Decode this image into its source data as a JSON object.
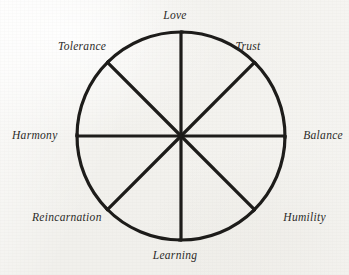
{
  "figure": {
    "name": "eight-spoked pinwheel diagram",
    "background_color": "#f1f0ec",
    "ink_color": "#1d1c1a",
    "center": {
      "x": 181,
      "y": 136
    },
    "spoke_length": 104,
    "spoke_count": 8,
    "spoke_angle_step_degrees": 45,
    "arc_sweep_degrees": 46,
    "stroke_width": 3.2,
    "labels": [
      {
        "id": "love",
        "text": "Love",
        "angle_degrees": 90,
        "position": "top"
      },
      {
        "id": "trust",
        "text": "Trust",
        "angle_degrees": 45,
        "position": "top-right"
      },
      {
        "id": "balance",
        "text": "Balance",
        "angle_degrees": 0,
        "position": "right"
      },
      {
        "id": "humility",
        "text": "Humility",
        "angle_degrees": 315,
        "position": "bottom-right"
      },
      {
        "id": "learning",
        "text": "Learning",
        "angle_degrees": 270,
        "position": "bottom"
      },
      {
        "id": "reincarnation",
        "text": "Reincarnation",
        "angle_degrees": 225,
        "position": "bottom-left"
      },
      {
        "id": "harmony",
        "text": "Harmony",
        "angle_degrees": 180,
        "position": "left"
      },
      {
        "id": "tolerance",
        "text": "Tolerance",
        "angle_degrees": 135,
        "position": "top-left"
      }
    ]
  }
}
